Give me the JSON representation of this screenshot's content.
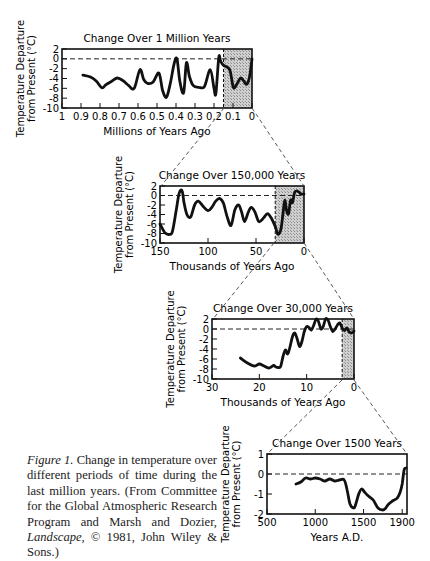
{
  "figure": {
    "caption_label": "Figure 1.",
    "caption_text": " Change in temperature over different periods of time during the last million years. (From Committee for the Global Atmospheric Research Program and Marsh and Dozier, ",
    "caption_italic": "Landscape,",
    "caption_tail": " © 1981, John Wiley & Sons.)"
  },
  "colors": {
    "line": "#111111",
    "shade": "#bdbdbd",
    "frame": "#111111"
  },
  "chart_data": [
    {
      "type": "line",
      "title": "Change Over 1 Million Years",
      "xlabel": "Millions of Years Ago",
      "ylabel": "Temperature Departure from Present (°C)",
      "ylim": [
        -10,
        2
      ],
      "xlim": [
        1,
        0
      ],
      "yticks": [
        "2",
        "0",
        "-2",
        "-4",
        "-6",
        "-8",
        "-10"
      ],
      "xticks": [
        "1",
        "0.9",
        "0.8",
        "0.7",
        "0.6",
        "0.5",
        "0.4",
        "0.3",
        "0.2",
        "0.1",
        "0"
      ],
      "shaded_range": [
        0.15,
        0
      ],
      "reference_line": 0,
      "x": [
        0.89,
        0.85,
        0.82,
        0.79,
        0.77,
        0.74,
        0.71,
        0.68,
        0.65,
        0.62,
        0.59,
        0.57,
        0.55,
        0.52,
        0.49,
        0.47,
        0.45,
        0.43,
        0.41,
        0.395,
        0.38,
        0.36,
        0.345,
        0.33,
        0.31,
        0.28,
        0.25,
        0.22,
        0.2,
        0.19,
        0.175,
        0.165,
        0.15,
        0.13,
        0.115,
        0.1,
        0.09,
        0.075,
        0.06,
        0.045,
        0.03,
        0.02,
        0.01,
        0.0
      ],
      "y": [
        -3.3,
        -3.7,
        -4.5,
        -5.9,
        -5.3,
        -4.6,
        -3.9,
        -4.4,
        -5.4,
        -6.0,
        -2.2,
        -4.2,
        -5.0,
        -4.7,
        -2.9,
        -6.5,
        -7.8,
        -5.0,
        -1.0,
        0.0,
        -4.5,
        -6.9,
        -0.8,
        -3.5,
        -5.4,
        -5.8,
        -5.6,
        -2.2,
        -6.0,
        -7.0,
        0.3,
        -0.5,
        -1.3,
        -1.7,
        -2.5,
        -5.6,
        -5.8,
        -4.8,
        -3.9,
        -4.4,
        -5.2,
        -4.7,
        -3.0,
        0.0
      ]
    },
    {
      "type": "line",
      "title": "Change Over 150,000 Years",
      "xlabel": "Thousands of Years Ago",
      "ylabel": "Temperature Departure from Present (°C)",
      "ylim": [
        -10,
        2
      ],
      "xlim": [
        150,
        0
      ],
      "yticks": [
        "2",
        "0",
        "-2",
        "-4",
        "-6",
        "-8",
        "-10"
      ],
      "xticks": [
        "150",
        "100",
        "50",
        "0"
      ],
      "shaded_range": [
        30,
        0
      ],
      "reference_line": 0,
      "x": [
        150,
        145,
        140,
        137,
        133,
        130,
        127,
        125,
        122,
        118,
        114,
        110,
        105,
        100,
        96,
        92,
        88,
        84,
        80,
        76,
        72,
        68,
        65,
        62,
        58,
        55,
        51,
        47,
        42,
        38,
        34,
        30,
        27,
        24,
        22,
        20,
        18,
        16,
        14,
        12,
        10,
        8,
        5,
        3,
        0
      ],
      "y": [
        -6,
        -7.8,
        -8.2,
        -7.5,
        -3,
        0.5,
        1,
        -1.5,
        -4,
        -4.5,
        -2,
        -1.2,
        -2.3,
        -3.2,
        -2.5,
        -1.2,
        -0.6,
        -1.6,
        -4.5,
        -6.3,
        -3,
        -2,
        -3.5,
        -5.5,
        -3.5,
        -2.5,
        -3.5,
        -5.5,
        -4.7,
        -3.8,
        -4.8,
        -6.5,
        -8.2,
        -7,
        -4,
        -1,
        -3.3,
        -3.8,
        -1,
        -1.5,
        0.5,
        1,
        0.7,
        0.3,
        0.3
      ]
    },
    {
      "type": "line",
      "title": "Change Over 30,000 Years",
      "xlabel": "Thousands of Years Ago",
      "ylabel": "Temperature Departure from Present (°C)",
      "ylim": [
        -10,
        2
      ],
      "xlim": [
        30,
        0
      ],
      "yticks": [
        "2",
        "0",
        "-2",
        "-4",
        "-6",
        "-8",
        "-10"
      ],
      "xticks": [
        "30",
        "20",
        "10",
        "0"
      ],
      "shaded_range": [
        2.5,
        0
      ],
      "reference_line": 0,
      "x": [
        24,
        22.5,
        21,
        20,
        19,
        18,
        17,
        16.5,
        16,
        15.5,
        15,
        14.5,
        14,
        13.5,
        13,
        12.5,
        12,
        11.5,
        11,
        10.5,
        10,
        9.5,
        9,
        8.5,
        8,
        7.5,
        7,
        6.5,
        6,
        5.5,
        5,
        4.5,
        4,
        3.5,
        3,
        2.5,
        2,
        1.5,
        1,
        0.5,
        0
      ],
      "y": [
        -5.8,
        -6.8,
        -7.4,
        -7,
        -7.4,
        -7.8,
        -7.3,
        -7.6,
        -7.7,
        -7.5,
        -5.5,
        -4.2,
        -5,
        -3.5,
        -1.5,
        -0.8,
        -2,
        -3.5,
        -2.5,
        -0.5,
        0.5,
        0.3,
        -0.2,
        0.8,
        2,
        1.5,
        0,
        0.5,
        2,
        1.8,
        0.5,
        -0.5,
        0,
        0.8,
        1.2,
        0.2,
        -0.3,
        0.2,
        -0.6,
        -0.8,
        -0.4
      ]
    },
    {
      "type": "line",
      "title": "Change Over 1500 Years",
      "xlabel": "Years A.D.",
      "ylabel": "Temperature Departure from Present (°C)",
      "ylim": [
        -2,
        1
      ],
      "xlim": [
        500,
        1950
      ],
      "yticks": [
        "1",
        "0",
        "-1",
        "-2"
      ],
      "xticks": [
        "500",
        "1000",
        "1500",
        "1900"
      ],
      "reference_line": 0,
      "x": [
        800,
        850,
        900,
        950,
        1000,
        1050,
        1100,
        1150,
        1200,
        1250,
        1300,
        1330,
        1360,
        1400,
        1420,
        1450,
        1480,
        1510,
        1550,
        1600,
        1650,
        1700,
        1730,
        1760,
        1800,
        1850,
        1880,
        1900,
        1920,
        1940
      ],
      "y": [
        -0.5,
        -0.4,
        -0.2,
        -0.25,
        -0.2,
        -0.25,
        -0.35,
        -0.25,
        -0.35,
        -0.3,
        -0.3,
        -0.8,
        -1.5,
        -1.7,
        -1.5,
        -1.0,
        -0.75,
        -0.9,
        -1.1,
        -1.3,
        -1.7,
        -1.8,
        -1.7,
        -1.5,
        -1.35,
        -1.2,
        -0.9,
        -0.5,
        0.2,
        0.3
      ]
    }
  ]
}
